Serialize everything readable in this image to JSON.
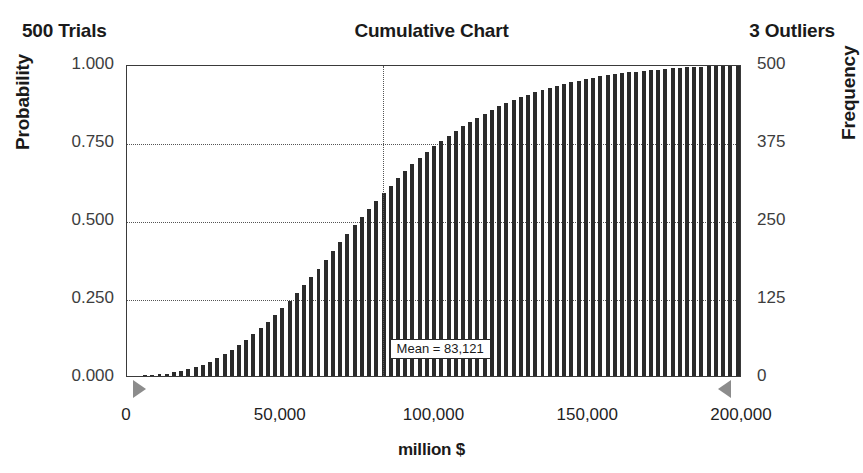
{
  "header": {
    "trials": "500 Trials",
    "title": "Cumulative Chart",
    "outliers": "3 Outliers"
  },
  "annotation": {
    "mean_label": "Mean = 83,121"
  },
  "axis_titles": {
    "left": "Probability",
    "right": "Frequency",
    "bottom": "million $"
  },
  "chart_data": {
    "type": "bar",
    "title": "Cumulative Chart",
    "subtitle_left": "500 Trials",
    "subtitle_right": "3 Outliers",
    "xlabel": "million $",
    "ylabel": "Probability",
    "y2label": "Frequency",
    "grid": true,
    "legend": "none",
    "xlim": [
      0,
      200000
    ],
    "ylim": [
      0.0,
      1.0
    ],
    "y2lim": [
      0,
      500
    ],
    "xticks": [
      0,
      50000,
      100000,
      150000,
      200000
    ],
    "xtick_labels": [
      "0",
      "50,000",
      "100,000",
      "150,000",
      "200,000"
    ],
    "yticks": [
      0.0,
      0.25,
      0.5,
      0.75,
      1.0
    ],
    "ytick_labels": [
      "0.000",
      "0.250",
      "0.500",
      "0.750",
      "1.000"
    ],
    "y2ticks": [
      0,
      125,
      250,
      375,
      500
    ],
    "y2tick_labels": [
      "0",
      "125",
      "250",
      "375",
      "500"
    ],
    "trials": 500,
    "outliers": 3,
    "mean": 83121,
    "annotations": [
      {
        "text": "Mean = 83,121",
        "x": 83121,
        "type": "mean-marker-line"
      }
    ],
    "markers": [
      {
        "name": "left-truncation-grabber",
        "x": 3000,
        "direction": "right"
      },
      {
        "name": "right-truncation-grabber",
        "x": 196000,
        "direction": "left"
      }
    ],
    "bin_width": 2350,
    "categories": [
      1175,
      3525,
      5875,
      8225,
      10575,
      12925,
      15275,
      17625,
      19975,
      22325,
      24675,
      27025,
      29375,
      31725,
      34075,
      36425,
      38775,
      41125,
      43475,
      45825,
      48175,
      50525,
      52875,
      55225,
      57575,
      59925,
      62275,
      64625,
      66975,
      69325,
      71675,
      74025,
      76375,
      78725,
      81075,
      83425,
      85775,
      88125,
      90475,
      92825,
      95175,
      97525,
      99875,
      102225,
      104575,
      106925,
      109275,
      111625,
      113975,
      116325,
      118675,
      121025,
      123375,
      125725,
      128075,
      130425,
      132775,
      135125,
      137475,
      139825,
      142175,
      144525,
      146875,
      149225,
      151575,
      153925,
      156275,
      158625,
      160975,
      163325,
      165675,
      168025,
      170375,
      172725,
      175075,
      177425,
      179775,
      182125,
      184475,
      186825,
      189175,
      191525,
      193875,
      196225,
      198575
    ],
    "values": [
      0.0,
      0.0,
      0.002,
      0.004,
      0.006,
      0.008,
      0.012,
      0.016,
      0.022,
      0.028,
      0.036,
      0.046,
      0.058,
      0.07,
      0.084,
      0.1,
      0.116,
      0.134,
      0.154,
      0.174,
      0.196,
      0.218,
      0.242,
      0.266,
      0.292,
      0.318,
      0.344,
      0.372,
      0.4,
      0.428,
      0.456,
      0.484,
      0.51,
      0.536,
      0.562,
      0.586,
      0.61,
      0.634,
      0.656,
      0.678,
      0.698,
      0.718,
      0.736,
      0.754,
      0.77,
      0.786,
      0.8,
      0.814,
      0.828,
      0.84,
      0.852,
      0.864,
      0.874,
      0.884,
      0.894,
      0.902,
      0.91,
      0.918,
      0.924,
      0.93,
      0.936,
      0.942,
      0.947,
      0.952,
      0.956,
      0.96,
      0.964,
      0.967,
      0.97,
      0.973,
      0.976,
      0.978,
      0.98,
      0.982,
      0.984,
      0.986,
      0.988,
      0.99,
      0.991,
      0.992,
      0.994,
      0.995,
      0.996,
      0.998,
      0.999
    ],
    "values_label": "Cumulative probability",
    "frequency_values_note": "Frequency = Probability x 500"
  }
}
